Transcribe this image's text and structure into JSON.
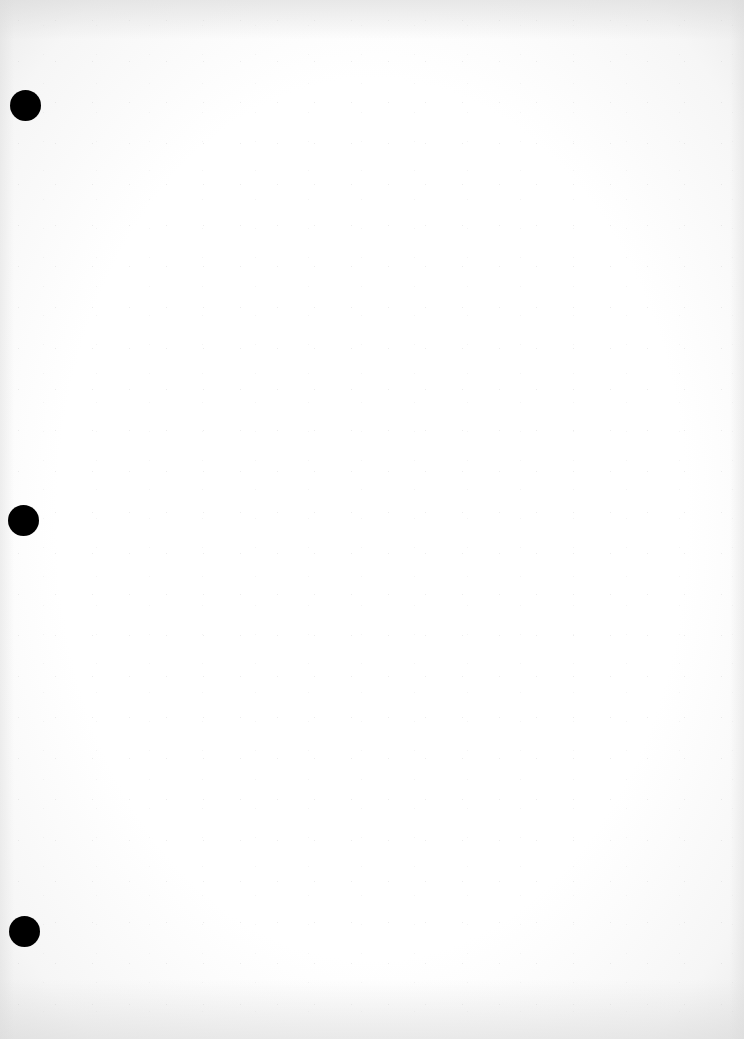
{
  "document": {
    "type": "blank-sheet",
    "background_color": "#ffffff",
    "hole_color": "#000000",
    "text_content": "",
    "punch_holes": [
      {
        "cx": 25,
        "cy": 105,
        "diameter": 31
      },
      {
        "cx": 23,
        "cy": 520,
        "diameter": 31
      },
      {
        "cx": 24,
        "cy": 931,
        "diameter": 31
      }
    ]
  }
}
